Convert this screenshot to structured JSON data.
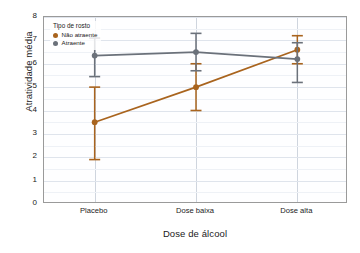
{
  "chart_data": {
    "type": "line",
    "title": "",
    "subtitle": "",
    "xlabel": "Dose de álcool",
    "ylabel": "Atratividade média",
    "categories": [
      "Placebo",
      "Dose baixa",
      "Dose alta"
    ],
    "ylim": [
      0,
      8
    ],
    "yticks": [
      0,
      1,
      2,
      3,
      4,
      5,
      6,
      7,
      8
    ],
    "ytick_labels": [
      "0",
      "1",
      "2",
      "3",
      "4",
      "5",
      "6",
      "7",
      "8"
    ],
    "grid": true,
    "grid_axis": "both",
    "legend_position": "upper-left",
    "legend_title": "Tipo de rosto",
    "series": [
      {
        "name": "Não atraente",
        "color": "#a9641e",
        "marker": "circle",
        "values": [
          3.5,
          5.0,
          6.6
        ],
        "error_low": [
          1.9,
          4.0,
          6.0
        ],
        "error_high": [
          5.0,
          6.0,
          7.2
        ]
      },
      {
        "name": "Atraente",
        "color": "#6b717a",
        "marker": "circle",
        "values": [
          6.35,
          6.5,
          6.2
        ],
        "error_low": [
          5.45,
          5.7,
          5.2
        ],
        "error_high": [
          7.1,
          7.3,
          6.9
        ]
      }
    ],
    "annotations": []
  }
}
